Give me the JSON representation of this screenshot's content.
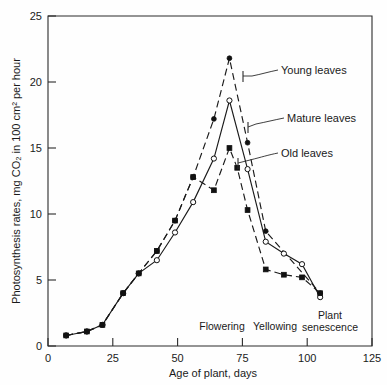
{
  "chart_data": {
    "type": "line",
    "title": "",
    "xlabel": "Age of plant, days",
    "ylabel": "Photosynthesis rates, mg CO₂ in 100 cm² per hour",
    "xlim": [
      0,
      125
    ],
    "ylim": [
      0,
      25
    ],
    "xticks": [
      0,
      25,
      50,
      75,
      100,
      125
    ],
    "yticks": [
      0,
      5,
      10,
      15,
      20,
      25
    ],
    "grid": false,
    "legend_position": "inline-annotations",
    "series": [
      {
        "name": "Young leaves",
        "marker": "filled-circle",
        "linestyle": "dashed",
        "points": [
          [
            7,
            0.8
          ],
          [
            15,
            1.1
          ],
          [
            21,
            1.6
          ],
          [
            29,
            4.0
          ],
          [
            35,
            5.5
          ],
          [
            42,
            7.2
          ],
          [
            49,
            9.5
          ],
          [
            56,
            12.8
          ],
          [
            64,
            17.2
          ],
          [
            70,
            21.8
          ],
          [
            77,
            15.4
          ],
          [
            84,
            8.7
          ],
          [
            105,
            4.0
          ]
        ]
      },
      {
        "name": "Mature leaves",
        "marker": "open-circle",
        "linestyle": "solid",
        "points": [
          [
            7,
            0.8
          ],
          [
            15,
            1.1
          ],
          [
            21,
            1.6
          ],
          [
            29,
            4.0
          ],
          [
            35,
            5.5
          ],
          [
            42,
            6.5
          ],
          [
            49,
            8.6
          ],
          [
            56,
            10.9
          ],
          [
            64,
            14.2
          ],
          [
            70,
            18.6
          ],
          [
            77,
            13.4
          ],
          [
            84,
            7.9
          ],
          [
            91,
            7.0
          ],
          [
            98,
            6.2
          ],
          [
            105,
            3.7
          ]
        ]
      },
      {
        "name": "Old leaves",
        "marker": "filled-square",
        "linestyle": "dashed",
        "points": [
          [
            7,
            0.8
          ],
          [
            15,
            1.1
          ],
          [
            21,
            1.6
          ],
          [
            29,
            4.0
          ],
          [
            35,
            5.5
          ],
          [
            42,
            7.2
          ],
          [
            49,
            9.5
          ],
          [
            56,
            12.8
          ],
          [
            64,
            11.8
          ],
          [
            70,
            15.0
          ],
          [
            73,
            13.5
          ],
          [
            77,
            10.3
          ],
          [
            84,
            5.8
          ],
          [
            91,
            5.4
          ],
          [
            98,
            5.2
          ],
          [
            105,
            4.0
          ]
        ]
      }
    ],
    "annotations": [
      {
        "text": "Flowering",
        "x": 67
      },
      {
        "text": "Yellowing",
        "x": 87
      },
      {
        "text": "Plant",
        "x": 107
      },
      {
        "text": "senescence",
        "x": 107
      }
    ]
  },
  "axis": {
    "y_title": "Photosynthesis rates, mg CO₂ in 100 cm² per hour",
    "x_title": "Age of plant, days",
    "x_tick_labels": [
      "0",
      "25",
      "50",
      "75",
      "100",
      "125"
    ],
    "y_tick_labels": [
      "0",
      "5",
      "10",
      "15",
      "20",
      "25"
    ]
  },
  "labels": {
    "young": "Young leaves",
    "mature": "Mature leaves",
    "old": "Old leaves",
    "flowering": "Flowering",
    "yellowing": "Yellowing",
    "plant": "Plant",
    "senescence": "senescence"
  },
  "colors": {
    "ink": "#1a1a1a",
    "background": "#fefefe"
  }
}
